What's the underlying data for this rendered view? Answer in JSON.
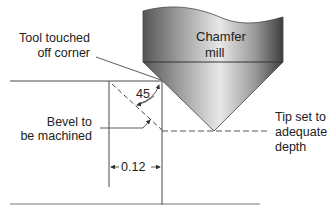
{
  "diagram": {
    "tool": {
      "label_line1": "Chamfer",
      "label_line2": "mill"
    },
    "labels": {
      "touch_line1": "Tool touched",
      "touch_line2": "off corner",
      "bevel_line1": "Bevel to",
      "bevel_line2": "be machined",
      "tip_line1": "Tip set to",
      "tip_line2": "adequate",
      "tip_line3": "depth"
    },
    "angle": "45",
    "dimension": "0.12",
    "colors": {
      "line": "#333333",
      "tool_dark": "#4a4a4a",
      "tool_light": "#e6e6e6"
    }
  }
}
